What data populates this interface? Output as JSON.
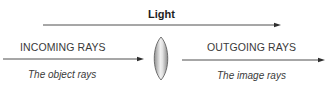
{
  "title": "Light",
  "left": {
    "heading": "INCOMING RAYS",
    "caption": "The object rays"
  },
  "right": {
    "heading": "OUTGOING RAYS",
    "caption": "The image rays"
  },
  "elements": {
    "top_arrow": "light-direction-arrow",
    "left_arrow": "incoming-ray-arrow",
    "lens": "convex-lens",
    "right_arrow": "outgoing-ray-arrow"
  },
  "colors": {
    "line": "#3a3a3a",
    "lens_fill_center": "#f2f2f2",
    "lens_fill_edge": "#9a9a9a",
    "lens_stroke": "#555555"
  }
}
